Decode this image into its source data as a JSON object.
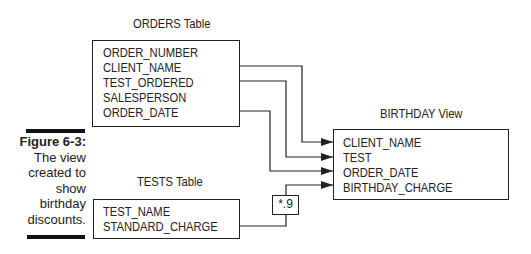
{
  "figure": {
    "label": "Figure 6-3:",
    "caption_lines": [
      "The view",
      "created to",
      "show",
      "birthday",
      "discounts."
    ]
  },
  "orders_table": {
    "title": "ORDERS Table",
    "fields": [
      "ORDER_NUMBER",
      "CLIENT_NAME",
      "TEST_ORDERED",
      "SALESPERSON",
      "ORDER_DATE"
    ]
  },
  "tests_table": {
    "title": "TESTS Table",
    "fields": [
      "TEST_NAME",
      "STANDARD_CHARGE"
    ]
  },
  "birthday_view": {
    "title": "BIRTHDAY View",
    "fields": [
      "CLIENT_NAME",
      "TEST",
      "ORDER_DATE",
      "BIRTHDAY_CHARGE"
    ]
  },
  "multiplier": {
    "label": "*.9"
  },
  "connections": [
    {
      "from": "ORDERS.CLIENT_NAME",
      "to": "BIRTHDAY.CLIENT_NAME"
    },
    {
      "from": "ORDERS.TEST_ORDERED",
      "to": "BIRTHDAY.TEST"
    },
    {
      "from": "ORDERS.ORDER_DATE",
      "to": "BIRTHDAY.ORDER_DATE"
    },
    {
      "from": "TESTS.STANDARD_CHARGE",
      "via": "*.9",
      "to": "BIRTHDAY.BIRTHDAY_CHARGE"
    }
  ],
  "colors": {
    "line": "#222222",
    "text": "#222222",
    "background": "#ffffff"
  }
}
